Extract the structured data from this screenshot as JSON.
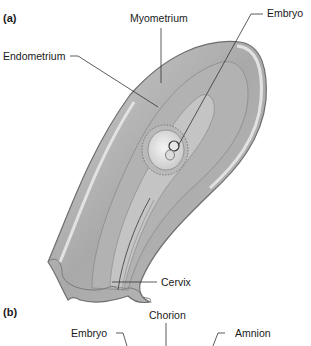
{
  "panel_a": {
    "label": "(a)",
    "labels": {
      "myometrium": "Myometrium",
      "embryo": "Embryo",
      "endometrium": "Endometrium",
      "cervix": "Cervix"
    }
  },
  "panel_b": {
    "label": "(b)",
    "labels": {
      "chorion": "Chorion",
      "embryo": "Embryo",
      "amnion": "Amnion"
    }
  },
  "colors": {
    "tissue_outer": "#b8b8b8",
    "tissue_mid": "#a4a4a4",
    "tissue_light": "#d6d6d6",
    "outline": "#6e6e6e",
    "leader_line": "#333333",
    "text": "#1a1a1a"
  }
}
